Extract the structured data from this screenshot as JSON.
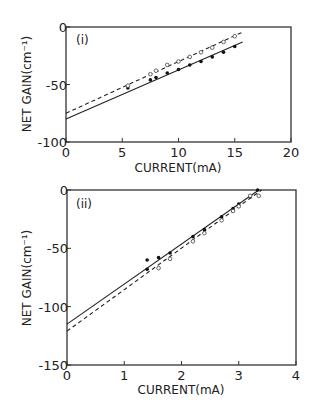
{
  "chart_data": [
    {
      "type": "scatter",
      "panel_label": "(i)",
      "xlabel": "CURRENT(mA)",
      "ylabel": "NET GAIN(cm⁻¹)",
      "xlim": [
        0,
        20
      ],
      "ylim": [
        -100,
        0
      ],
      "xticks": [
        0,
        5,
        10,
        15,
        20
      ],
      "yticks": [
        0,
        -50,
        -100
      ],
      "xtick_labels": [
        "0",
        "5",
        "10",
        "15",
        "20"
      ],
      "ytick_labels": [
        "0",
        "-50",
        "-100"
      ],
      "grid": false,
      "series": [
        {
          "name": "solid",
          "marker": "filled",
          "x": [
            5.5,
            7.5,
            8,
            9,
            10,
            11,
            12,
            13,
            14,
            15
          ],
          "y": [
            -53,
            -46,
            -44,
            -40,
            -37,
            -33,
            -30,
            -26,
            -22,
            -17
          ]
        },
        {
          "name": "dashed",
          "marker": "open",
          "x": [
            5.5,
            7.5,
            8,
            9,
            10,
            11,
            12,
            13,
            14,
            15
          ],
          "y": [
            -51,
            -41,
            -38,
            -33,
            -30,
            -26,
            -22,
            -18,
            -13,
            -8
          ]
        }
      ],
      "fit_lines": [
        {
          "name": "solid-fit",
          "style": "solid",
          "x": [
            0,
            15.7
          ],
          "y": [
            -80,
            -13
          ]
        },
        {
          "name": "dashed-fit",
          "style": "dashed",
          "x": [
            0,
            15.8
          ],
          "y": [
            -75,
            -4
          ]
        }
      ]
    },
    {
      "type": "scatter",
      "panel_label": "(ii)",
      "xlabel": "CURRENT(mA)",
      "ylabel": "NET GAIN(cm⁻¹)",
      "xlim": [
        0,
        4
      ],
      "ylim": [
        -150,
        0
      ],
      "xticks": [
        0,
        1,
        2,
        3,
        4
      ],
      "yticks": [
        0,
        -50,
        -100,
        -150
      ],
      "xtick_labels": [
        "0",
        "1",
        "2",
        "3",
        "4"
      ],
      "ytick_labels": [
        "0",
        "-50",
        "-100",
        "-150"
      ],
      "grid": false,
      "series": [
        {
          "name": "solid",
          "marker": "filled",
          "x": [
            1.4,
            1.4,
            1.6,
            1.8,
            2.2,
            2.4,
            2.7,
            2.9,
            3.0,
            3.2,
            3.33
          ],
          "y": [
            -60,
            -68,
            -58,
            -54,
            -40,
            -34,
            -23,
            -16,
            -12,
            -6,
            0
          ]
        },
        {
          "name": "dashed",
          "marker": "open",
          "x": [
            1.6,
            1.8,
            2.2,
            2.4,
            2.7,
            2.9,
            3.0,
            3.2,
            3.35
          ],
          "y": [
            -67,
            -59,
            -44,
            -37,
            -26,
            -18,
            -14,
            -5,
            -5
          ]
        }
      ],
      "fit_lines": [
        {
          "name": "solid-fit",
          "style": "solid",
          "x": [
            0,
            3.35
          ],
          "y": [
            -115,
            0
          ]
        },
        {
          "name": "dashed-fit",
          "style": "dashed",
          "x": [
            0,
            3.4
          ],
          "y": [
            -121,
            0
          ]
        }
      ]
    }
  ]
}
